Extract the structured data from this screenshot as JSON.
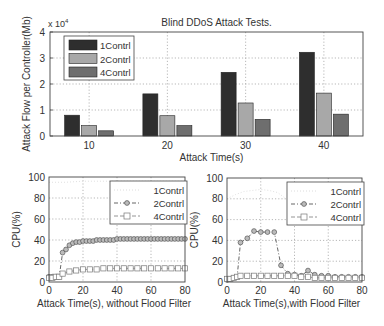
{
  "chart_data": [
    {
      "type": "bar",
      "title": "Blind DDoS Attack Tests.",
      "xlabel": "Attack Time(s)",
      "ylabel": "Attack Flow per Controller(Mb)",
      "y_multiplier": "x 10^4",
      "ylim": [
        0,
        4
      ],
      "yticks": [
        0,
        1,
        2,
        3,
        4
      ],
      "grid": true,
      "legend_position": "upper-left",
      "categories": [
        "10",
        "20",
        "30",
        "40"
      ],
      "series": [
        {
          "name": "1Contrl",
          "color": "#2e2e2e",
          "values": [
            0.8,
            1.62,
            2.45,
            3.22
          ]
        },
        {
          "name": "2Contrl",
          "color": "#a8a8a8",
          "values": [
            0.4,
            0.78,
            1.27,
            1.65
          ]
        },
        {
          "name": "4Contrl",
          "color": "#6e6e6e",
          "values": [
            0.2,
            0.4,
            0.64,
            0.84
          ]
        }
      ]
    },
    {
      "type": "line",
      "title": "",
      "xlabel": "Attack Time(s), without Flood Filter",
      "ylabel": "CPU(%)",
      "xlim": [
        0,
        80
      ],
      "ylim": [
        0,
        100
      ],
      "xticks": [
        0,
        20,
        40,
        60,
        80
      ],
      "yticks": [
        0,
        20,
        40,
        60,
        80,
        100
      ],
      "grid": true,
      "legend_position": "upper-right",
      "series": [
        {
          "name": "1Contrl",
          "style": "faint-dotted",
          "color": "#d8d8d8",
          "x": [
            0,
            10,
            20,
            30,
            40,
            50,
            60,
            70,
            80
          ],
          "y": [
            95,
            95,
            96,
            96,
            96,
            96,
            96,
            96,
            96
          ]
        },
        {
          "name": "2Contrl",
          "style": "dash-dot-circle",
          "color": "#555555",
          "x": [
            0,
            2,
            4,
            6,
            8,
            10,
            12,
            14,
            16,
            18,
            20,
            22,
            24,
            26,
            28,
            30,
            32,
            34,
            36,
            38,
            40,
            42,
            44,
            46,
            48,
            50,
            52,
            54,
            56,
            58,
            60,
            62,
            64,
            66,
            68,
            70,
            72,
            74,
            76,
            78,
            80
          ],
          "y": [
            5,
            5,
            5,
            5,
            28,
            31,
            35,
            37,
            38,
            38,
            39,
            39,
            39,
            39,
            40,
            40,
            40,
            40,
            40,
            40,
            41,
            41,
            41,
            41,
            41,
            41,
            41,
            41,
            41,
            41,
            41,
            41,
            41,
            41,
            41,
            41,
            41,
            41,
            41,
            41,
            41
          ]
        },
        {
          "name": "4Contrl",
          "style": "dash-square",
          "color": "#888888",
          "x": [
            0,
            2,
            4,
            6,
            8,
            12,
            16,
            20,
            24,
            28,
            32,
            36,
            40,
            44,
            48,
            52,
            56,
            60,
            64,
            68,
            72,
            76,
            80
          ],
          "y": [
            4,
            4,
            5,
            5,
            8,
            10,
            11,
            12,
            12,
            12,
            13,
            13,
            13,
            13,
            13,
            13,
            13,
            13,
            13,
            13,
            13,
            13,
            13
          ]
        }
      ]
    },
    {
      "type": "line",
      "title": "",
      "xlabel": "Attack Time(s),with Flood Filter",
      "ylabel": "CPU(%)",
      "xlim": [
        0,
        80
      ],
      "ylim": [
        0,
        100
      ],
      "xticks": [
        0,
        20,
        40,
        60,
        80
      ],
      "yticks": [
        0,
        20,
        40,
        60,
        80,
        100
      ],
      "grid": true,
      "legend_position": "upper-right",
      "series": [
        {
          "name": "1Contrl",
          "style": "faint-dotted",
          "color": "#d8d8d8",
          "x": [
            0,
            5,
            10,
            15,
            20,
            25,
            30,
            35
          ],
          "y": [
            80,
            84,
            87,
            88,
            89,
            88,
            86,
            80
          ]
        },
        {
          "name": "2Contrl",
          "style": "dash-dot-circle",
          "color": "#555555",
          "x": [
            0,
            2,
            4,
            6,
            8,
            12,
            16,
            20,
            24,
            28,
            32,
            36,
            40,
            44,
            48,
            52,
            56,
            60,
            64,
            68,
            72,
            76,
            80
          ],
          "y": [
            2,
            3,
            4,
            5,
            38,
            42,
            49,
            48,
            48,
            48,
            16,
            8,
            7,
            6,
            11,
            7,
            6,
            6,
            5,
            5,
            5,
            5,
            5
          ]
        },
        {
          "name": "4Contrl",
          "style": "dash-square",
          "color": "#888888",
          "x": [
            0,
            2,
            4,
            6,
            8,
            12,
            16,
            20,
            24,
            28,
            32,
            36,
            40,
            44,
            48,
            52,
            56,
            60,
            64,
            68,
            72,
            76,
            80
          ],
          "y": [
            3,
            3,
            4,
            5,
            6,
            6,
            6,
            6,
            6,
            6,
            6,
            6,
            6,
            5,
            5,
            4,
            4,
            4,
            4,
            4,
            4,
            4,
            4
          ]
        }
      ]
    }
  ]
}
